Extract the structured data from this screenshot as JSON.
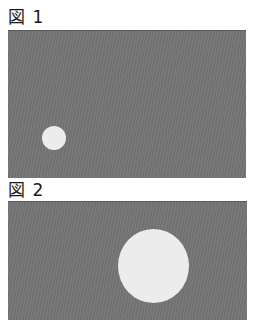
{
  "figures": [
    {
      "label": "図 1",
      "panel_color": "#757575",
      "circle": {
        "color": "#ececec",
        "size": "small"
      }
    },
    {
      "label": "図 2",
      "panel_color": "#757575",
      "circle": {
        "color": "#ececec",
        "size": "large"
      }
    }
  ]
}
